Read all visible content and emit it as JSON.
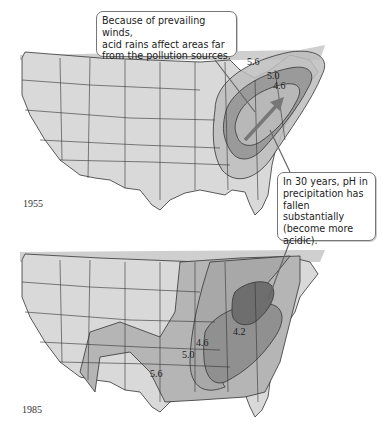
{
  "figure": {
    "panels": [
      {
        "year": "1955",
        "contours": [
          {
            "ph": "5.6",
            "fill": "#bdbdbd"
          },
          {
            "ph": "5.0",
            "fill": "#9a9a9a"
          },
          {
            "ph": "4.6",
            "fill": "#b8b8b8"
          }
        ],
        "arrow": "prevailing-wind-arrow"
      },
      {
        "year": "1985",
        "contours": [
          {
            "ph": "5.6",
            "fill": "#b5b5b5"
          },
          {
            "ph": "5.0",
            "fill": "#a8a8a8"
          },
          {
            "ph": "4.6",
            "fill": "#909090"
          },
          {
            "ph": "4.2",
            "fill": "#6e6e6e"
          }
        ]
      }
    ],
    "callouts": {
      "winds": "Because of prevailing winds, acid rains affect areas far from the pollution sources.",
      "winds_lines": [
        "Because of prevailing winds,",
        "acid rains affect areas far",
        "from the pollution sources."
      ],
      "ph_change_lines": [
        "In 30 years, pH in",
        "precipitation has",
        "fallen substantially",
        "(become more",
        "acidic)."
      ]
    },
    "colors": {
      "land": "#d9d9d9",
      "border": "#333333",
      "background": "#ffffff"
    }
  }
}
